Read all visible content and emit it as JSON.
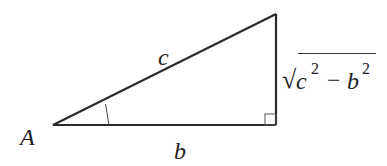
{
  "diagram": {
    "type": "right-triangle",
    "colors": {
      "stroke": "#2a2a2a",
      "text": "#222222",
      "background": "#ffffff"
    },
    "vertices": {
      "A": {
        "x": 53,
        "y": 125
      },
      "right_angle": {
        "x": 276,
        "y": 125
      },
      "top": {
        "x": 276,
        "y": 14
      }
    },
    "labels": {
      "vertex_A": "A",
      "hypotenuse": "c",
      "adjacent": "b",
      "opposite": {
        "radical": "√",
        "term1_base": "c",
        "term1_exp": "2",
        "operator": "−",
        "term2_base": "b",
        "term2_exp": "2"
      }
    },
    "markers": {
      "right_angle_square": true,
      "angle_A_arc": true
    }
  }
}
